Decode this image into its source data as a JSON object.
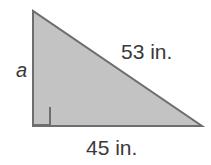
{
  "figure": {
    "kind": "right-triangle-diagram",
    "background_color": "#ffffff",
    "fill_color": "#c3c3c3",
    "stroke_color": "#6e6e6e",
    "stroke_width": 2,
    "text_color": "#3a3a3a",
    "vertices": {
      "apex": [
        33,
        11
      ],
      "bottom_left": [
        33,
        126
      ],
      "bottom_right": [
        202,
        126
      ]
    },
    "right_angle_marker": {
      "at": "bottom_left",
      "size": 17
    },
    "labels": {
      "leg_a": "a",
      "hypotenuse": "53 in.",
      "base": "45 in."
    }
  }
}
